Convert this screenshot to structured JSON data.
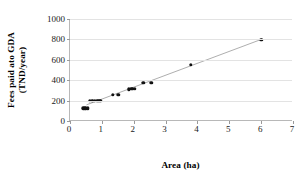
{
  "chart_data": {
    "type": "scatter",
    "title": "",
    "xlabel": "Area (ha)",
    "ylabel_line1": "Fees paid ato GDA",
    "ylabel_line2": "(TND/year)",
    "xlim": [
      0,
      7
    ],
    "ylim": [
      0,
      1000
    ],
    "xticks": [
      0,
      1,
      2,
      3,
      4,
      5,
      6,
      7
    ],
    "yticks": [
      0,
      200,
      400,
      600,
      800,
      1000
    ],
    "xtick_labels": [
      "0",
      "1",
      "2",
      "3",
      "4",
      "5",
      "6",
      "7"
    ],
    "ytick_labels": [
      "0",
      "200",
      "400",
      "600",
      "800",
      "1000"
    ],
    "grid": "horizontal",
    "legend": "none",
    "marker": "filled-circle",
    "marker_color": "#111111",
    "trendline_color": "#8a8a8a",
    "axis_color": "#b8b8b8",
    "gridline_color": "#e3e3e3",
    "series": [
      {
        "name": "Fees paid ato GDA",
        "x": [
          0.42,
          0.46,
          0.5,
          0.55,
          0.62,
          0.7,
          0.78,
          0.86,
          0.92,
          0.97,
          1.35,
          1.52,
          1.84,
          1.92,
          1.98,
          2.04,
          2.3,
          2.55,
          3.8,
          6.0
        ],
        "y": [
          125,
          125,
          125,
          125,
          200,
          200,
          200,
          200,
          200,
          200,
          255,
          255,
          310,
          315,
          315,
          318,
          375,
          375,
          550,
          795
        ]
      }
    ],
    "trendline": {
      "x": [
        0.52,
        6.05
      ],
      "y": [
        150,
        800
      ]
    }
  }
}
